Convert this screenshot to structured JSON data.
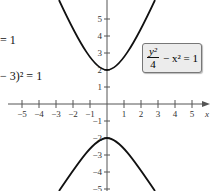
{
  "left_equations": [
    {
      "text": "= 1"
    },
    {
      "text": "− 3)² = 1"
    }
  ],
  "equation_box": {
    "numerator": "y²",
    "denominator": "4",
    "rest": "− x² = 1"
  },
  "axes": {
    "x_label": "x",
    "x_ticks": [
      "−5",
      "−4",
      "−3",
      "−2",
      "−1",
      "1",
      "2",
      "3",
      "4",
      "5"
    ],
    "y_ticks_pos": [
      "5",
      "4",
      "3",
      "2",
      "1"
    ],
    "y_ticks_neg": [
      "−1",
      "−2",
      "−3",
      "−4",
      "−5"
    ]
  },
  "colors": {
    "curve": "#111111",
    "axis": "#555555",
    "box_bg": "#ececec"
  }
}
